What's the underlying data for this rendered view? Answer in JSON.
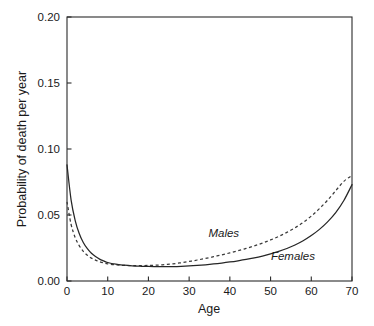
{
  "chart_data": {
    "type": "line",
    "title": "",
    "xlabel": "Age",
    "ylabel": "Probability of death per year",
    "xlim": [
      0,
      70
    ],
    "ylim": [
      0.0,
      0.2
    ],
    "grid": false,
    "legend_position": "inline-annotation",
    "xticks": [
      0,
      10,
      20,
      30,
      40,
      50,
      60,
      70
    ],
    "xticklabels": [
      "0",
      "10",
      "20",
      "30",
      "40",
      "50",
      "60",
      "70"
    ],
    "yticks": [
      0.0,
      0.05,
      0.1,
      0.15,
      0.2
    ],
    "yticklabels": [
      "0.00",
      "0.05",
      "0.10",
      "0.15",
      "0.20"
    ],
    "series": [
      {
        "name": "Males",
        "style": "dashed",
        "color": "#3a3a3a",
        "label_text": "Males",
        "x": [
          0,
          1,
          2,
          3,
          4,
          5,
          6,
          7,
          8,
          9,
          10,
          12,
          14,
          16,
          18,
          20,
          22,
          24,
          26,
          28,
          30,
          32,
          34,
          36,
          38,
          40,
          42,
          44,
          46,
          48,
          50,
          52,
          54,
          56,
          58,
          60,
          62,
          64,
          66,
          68,
          70
        ],
        "values": [
          0.06,
          0.043,
          0.033,
          0.0268,
          0.0225,
          0.0195,
          0.0173,
          0.0158,
          0.0146,
          0.0137,
          0.013,
          0.0122,
          0.0118,
          0.0117,
          0.0117,
          0.0118,
          0.012,
          0.0124,
          0.013,
          0.0138,
          0.0148,
          0.0159,
          0.0171,
          0.0184,
          0.0198,
          0.0213,
          0.0229,
          0.0247,
          0.0266,
          0.0287,
          0.0311,
          0.0338,
          0.0368,
          0.0403,
          0.0444,
          0.0492,
          0.0548,
          0.0612,
          0.0684,
          0.0755,
          0.08
        ]
      },
      {
        "name": "Females",
        "style": "solid",
        "color": "#262626",
        "label_text": "Females",
        "x": [
          0,
          1,
          2,
          3,
          4,
          5,
          6,
          7,
          8,
          9,
          10,
          12,
          14,
          16,
          18,
          20,
          22,
          24,
          26,
          28,
          30,
          32,
          34,
          36,
          38,
          40,
          42,
          44,
          46,
          48,
          50,
          52,
          54,
          56,
          58,
          60,
          62,
          64,
          66,
          68,
          70
        ],
        "values": [
          0.088,
          0.0615,
          0.046,
          0.036,
          0.0292,
          0.0245,
          0.021,
          0.0185,
          0.0166,
          0.0152,
          0.014,
          0.0127,
          0.012,
          0.0115,
          0.0112,
          0.011,
          0.0109,
          0.0108,
          0.0109,
          0.0111,
          0.0114,
          0.0118,
          0.0123,
          0.0129,
          0.0136,
          0.0144,
          0.0153,
          0.0163,
          0.0175,
          0.0189,
          0.0205,
          0.0224,
          0.0246,
          0.0273,
          0.0305,
          0.0344,
          0.0391,
          0.0448,
          0.0518,
          0.061,
          0.073
        ]
      }
    ],
    "annotations": [
      {
        "name": "males-curve-label",
        "text": "Males",
        "x": 38.5,
        "y": 0.033
      },
      {
        "name": "females-curve-label",
        "text": "Females",
        "x": 55.5,
        "y": 0.016
      }
    ]
  },
  "axes": {
    "x_title": "Age",
    "y_title": "Probability of death per year"
  }
}
